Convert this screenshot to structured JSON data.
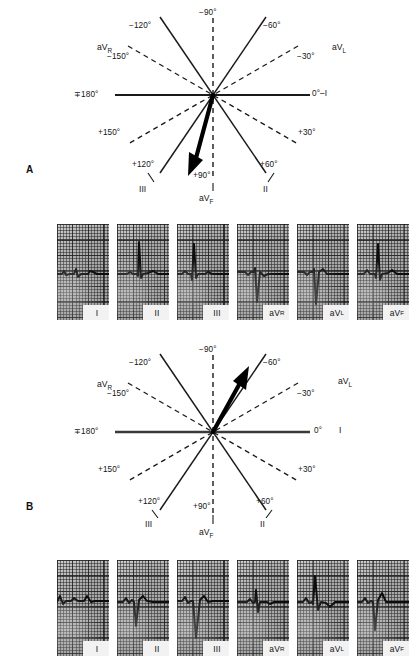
{
  "figure": {
    "panels": [
      {
        "letter": "A",
        "caption_axis_deg": 105,
        "diagram": {
          "center_label_axes": [
            {
              "name": "axis-0",
              "text": "0°–I",
              "degrees": 0,
              "style": "solid",
              "lead": "I"
            },
            {
              "name": "axis-180",
              "text": "∓180°",
              "degrees": 180,
              "style": "solid",
              "lead": "I"
            },
            {
              "name": "axis-minus-60",
              "text": "−60°",
              "degrees": -60,
              "style": "solid",
              "lead": "III"
            },
            {
              "name": "axis-plus-120",
              "text": "+120°",
              "degrees": 120,
              "style": "solid",
              "lead": "III"
            },
            {
              "name": "axis-minus-120",
              "text": "−120°",
              "degrees": -120,
              "style": "solid",
              "lead": "II"
            },
            {
              "name": "axis-plus-60",
              "text": "+60°",
              "degrees": 60,
              "style": "solid",
              "lead": "II"
            },
            {
              "name": "axis-minus-90",
              "text": "−90°",
              "degrees": -90,
              "style": "dashed",
              "lead": "aVF"
            },
            {
              "name": "axis-plus-90",
              "text": "+90°",
              "degrees": 90,
              "style": "dashed",
              "lead": "aVF"
            },
            {
              "name": "axis-minus-150",
              "text": "−150°",
              "degrees": -150,
              "style": "dashed",
              "lead": "aVR"
            },
            {
              "name": "axis-plus-30",
              "text": "+30°",
              "degrees": 30,
              "style": "dashed",
              "lead": "aVR"
            },
            {
              "name": "axis-minus-30",
              "text": "−30°",
              "degrees": -30,
              "style": "dashed",
              "lead": "aVL"
            },
            {
              "name": "axis-plus-150",
              "text": "+150°",
              "degrees": 150,
              "style": "dashed",
              "lead": "aVL"
            }
          ],
          "lead_names": {
            "avr": "aVR",
            "avl": "aVL",
            "avf": "aVF",
            "lead_one": "I",
            "lead_two": "II",
            "lead_three": "III"
          },
          "mean_vector": {
            "name": "mean-qrs-axis-arrow",
            "degrees": 105,
            "description": "thick arrow directed inferiorly and slightly rightward"
          }
        },
        "strips": [
          {
            "label": "I",
            "sub": "",
            "morphology": "isoelectric-biphasic"
          },
          {
            "label": "II",
            "sub": "",
            "morphology": "tall-R"
          },
          {
            "label": "III",
            "sub": "",
            "morphology": "tall-R"
          },
          {
            "label": "aV",
            "sub": "R",
            "morphology": "deep-QS"
          },
          {
            "label": "aV",
            "sub": "L",
            "morphology": "deep-QS"
          },
          {
            "label": "aV",
            "sub": "F",
            "morphology": "tall-R"
          }
        ]
      },
      {
        "letter": "B",
        "caption_axis_deg": -60,
        "diagram": {
          "center_label_axes": [
            {
              "name": "axis-0",
              "text": "0°  I",
              "degrees": 0,
              "style": "solid",
              "lead": "I"
            },
            {
              "name": "axis-180",
              "text": "∓180°",
              "degrees": 180,
              "style": "solid",
              "lead": "I"
            },
            {
              "name": "axis-minus-60",
              "text": "−60°",
              "degrees": -60,
              "style": "solid",
              "lead": "III"
            },
            {
              "name": "axis-plus-120",
              "text": "+120°",
              "degrees": 120,
              "style": "solid",
              "lead": "III"
            },
            {
              "name": "axis-minus-120",
              "text": "−120°",
              "degrees": -120,
              "style": "solid",
              "lead": "II"
            },
            {
              "name": "axis-plus-60",
              "text": "+60°",
              "degrees": 60,
              "style": "solid",
              "lead": "II"
            },
            {
              "name": "axis-minus-90",
              "text": "−90°",
              "degrees": -90,
              "style": "dashed",
              "lead": "aVF"
            },
            {
              "name": "axis-plus-90",
              "text": "+90°",
              "degrees": 90,
              "style": "dashed",
              "lead": "aVF"
            },
            {
              "name": "axis-minus-150",
              "text": "−150°",
              "degrees": -150,
              "style": "dashed",
              "lead": "aVR"
            },
            {
              "name": "axis-plus-30",
              "text": "+30°",
              "degrees": 30,
              "style": "dashed",
              "lead": "aVR"
            },
            {
              "name": "axis-minus-30",
              "text": "−30°",
              "degrees": -30,
              "style": "dashed",
              "lead": "aVL"
            },
            {
              "name": "axis-plus-150",
              "text": "+150°",
              "degrees": 150,
              "style": "dashed",
              "lead": "aVL"
            }
          ],
          "lead_names": {
            "avr": "aVR",
            "avl": "aVL",
            "avf": "aVF",
            "lead_one": "I",
            "lead_two": "II",
            "lead_three": "III"
          },
          "mean_vector": {
            "name": "mean-qrs-axis-arrow",
            "degrees": -60,
            "description": "thick arrow directed superiorly and leftward"
          }
        },
        "strips": [
          {
            "label": "I",
            "sub": "",
            "morphology": "upright-R"
          },
          {
            "label": "II",
            "sub": "",
            "morphology": "deep-S"
          },
          {
            "label": "III",
            "sub": "",
            "morphology": "deep-QS"
          },
          {
            "label": "aV",
            "sub": "R",
            "morphology": "small-rS"
          },
          {
            "label": "aV",
            "sub": "L",
            "morphology": "tall-R"
          },
          {
            "label": "aV",
            "sub": "F",
            "morphology": "deep-QS"
          }
        ]
      }
    ]
  },
  "labels": {
    "panel_a": "A",
    "panel_b": "B",
    "a": {
      "deg_minus_90": "−90°",
      "deg_minus_120": "−120°",
      "deg_minus_60": "−60°",
      "deg_minus_150": "−150°",
      "deg_minus_30": "−30°",
      "deg_180": "∓180°",
      "deg_0": "0°–I",
      "deg_plus_150": "+150°",
      "deg_plus_30": "+30°",
      "deg_plus_120": "+120°",
      "deg_plus_90": "+90°",
      "deg_plus_60": "+60°",
      "avr": "aV",
      "avr_sub": "R",
      "avl": "aV",
      "avl_sub": "L",
      "avf": "aV",
      "avf_sub": "F",
      "lead_iii": "III",
      "lead_ii": "II"
    },
    "b": {
      "deg_minus_90": "−90°",
      "deg_minus_120": "−120°",
      "deg_minus_60": "−60°",
      "deg_minus_150": "−150°",
      "deg_minus_30": "−30°",
      "deg_180": "∓180°",
      "deg_0": "0°",
      "lead_i": "I",
      "deg_plus_150": "+150°",
      "deg_plus_30": "+30°",
      "deg_plus_120": "+120°",
      "deg_plus_90": "+90°",
      "deg_plus_60": "+60°",
      "avr": "aV",
      "avr_sub": "R",
      "avl": "aV",
      "avl_sub": "L",
      "avf": "aV",
      "avf_sub": "F",
      "lead_iii": "III",
      "lead_ii": "II"
    },
    "strip_tags": {
      "i": "I",
      "ii": "II",
      "iii": "III",
      "av": "aV",
      "r": "R",
      "l": "L",
      "f": "F"
    }
  },
  "colors": {
    "ink": "#111111",
    "paper": "#ffffff",
    "grid_paper": "#b9b9b9",
    "grid_line": "#2a2a2a",
    "trace": "#0d0d0d",
    "tag_bg": "#f2f2f2"
  }
}
